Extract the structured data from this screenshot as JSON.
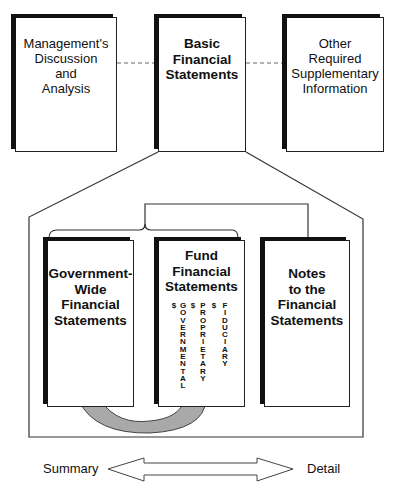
{
  "top_row": {
    "left_box": [
      "Management's",
      "Discussion",
      "and",
      "Analysis"
    ],
    "center_box": [
      "Basic",
      "Financial",
      "Statements"
    ],
    "right_box": [
      "Other",
      "Required",
      "Supplementary",
      "Information"
    ]
  },
  "inner_row": {
    "government_wide": [
      "Government-",
      "Wide",
      "Financial",
      "Statements"
    ],
    "fund": {
      "title": [
        "Fund",
        "Financial",
        "Statements"
      ],
      "columns": [
        {
          "symbol": "$",
          "label": "GOVERNMENTAL"
        },
        {
          "symbol": "$",
          "label": "PROPRIETARY"
        },
        {
          "symbol": "$",
          "label": "FIDUCIARY"
        }
      ]
    },
    "notes": [
      "Notes",
      "to the",
      "Financial",
      "Statements"
    ]
  },
  "scale": {
    "left_label": "Summary",
    "right_label": "Detail"
  },
  "colors": {
    "arrow_fill": "#a9a9a9",
    "line": "#333333"
  }
}
